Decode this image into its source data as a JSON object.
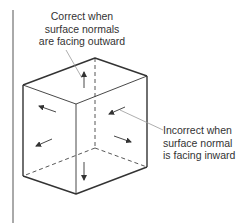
{
  "labels": {
    "correct": [
      "Correct when",
      "surface normals",
      "are facing outward"
    ],
    "incorrect": [
      "Incorrect when",
      "surface normal",
      "is facing inward"
    ]
  },
  "colors": {
    "line": "#333333",
    "leader": "#999999"
  }
}
